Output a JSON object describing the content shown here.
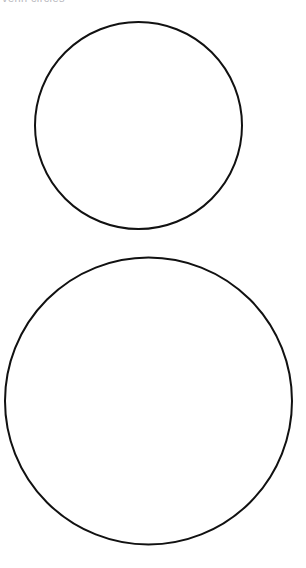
{
  "page": {
    "background_color": "#ffffff",
    "width": 306,
    "height": 568
  },
  "caption": {
    "text": "venn circles",
    "color": "#b8b8bd",
    "clipped": "true"
  },
  "figure": {
    "name": "two-circles-diagram",
    "stroke_color": "#111111",
    "fill_color": "#ffffff",
    "stroke_width": 2,
    "shapes": [
      {
        "name": "upper-circle",
        "type": "circle",
        "cx": 138.5,
        "cy": 125.5,
        "r": 103.5,
        "label": "Upper circle"
      },
      {
        "name": "lower-circle",
        "type": "circle",
        "cx": 148.5,
        "cy": 401,
        "r": 143.5,
        "label": "Lower circle"
      }
    ]
  }
}
